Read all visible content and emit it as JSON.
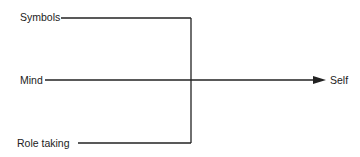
{
  "diagram": {
    "type": "flow",
    "nodes": {
      "symbols": "Symbols",
      "mind": "Mind",
      "role_taking": "Role taking",
      "self": "Self"
    },
    "edges": [
      {
        "from": "Symbols",
        "to": "Self"
      },
      {
        "from": "Mind",
        "to": "Self"
      },
      {
        "from": "Role taking",
        "to": "Self"
      }
    ],
    "colors": {
      "line": "#222222",
      "text": "#222222",
      "background": "#ffffff"
    }
  }
}
